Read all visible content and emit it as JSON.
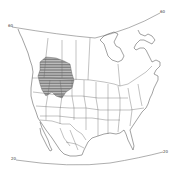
{
  "map": {
    "type": "range-map",
    "region": "North America",
    "colors": {
      "background": "#ffffff",
      "outline": "#555555",
      "hatch": "#666666"
    },
    "latitude_labels": {
      "top_left": "60",
      "top_right": "60",
      "bottom_left": "20",
      "bottom_right": "20"
    },
    "shaded_area": "hatched range region over northwestern United States and southwestern Canada"
  }
}
